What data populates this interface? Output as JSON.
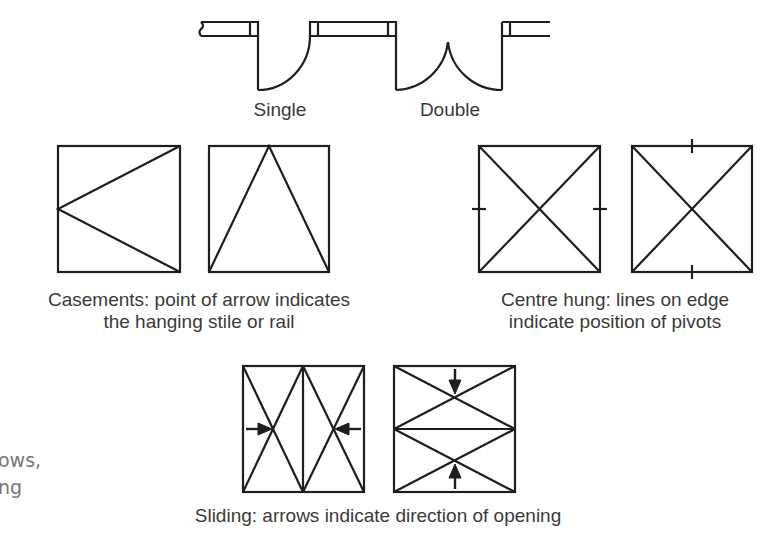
{
  "doors": {
    "single_label": "Single",
    "double_label": "Double"
  },
  "casements": {
    "caption_line1": "Casements: point of arrow indicates",
    "caption_line2": "the hanging stile or rail"
  },
  "centre_hung": {
    "caption_line1": "Centre hung: lines on edge",
    "caption_line2": "indicate position of pivots"
  },
  "sliding": {
    "caption": "Sliding: arrows indicate direction of opening"
  },
  "side_text": {
    "line1": "ows,",
    "line2": "ng"
  },
  "colors": {
    "line": "#1e1e1e",
    "text": "#3a3a3a",
    "side_text": "#777777"
  }
}
